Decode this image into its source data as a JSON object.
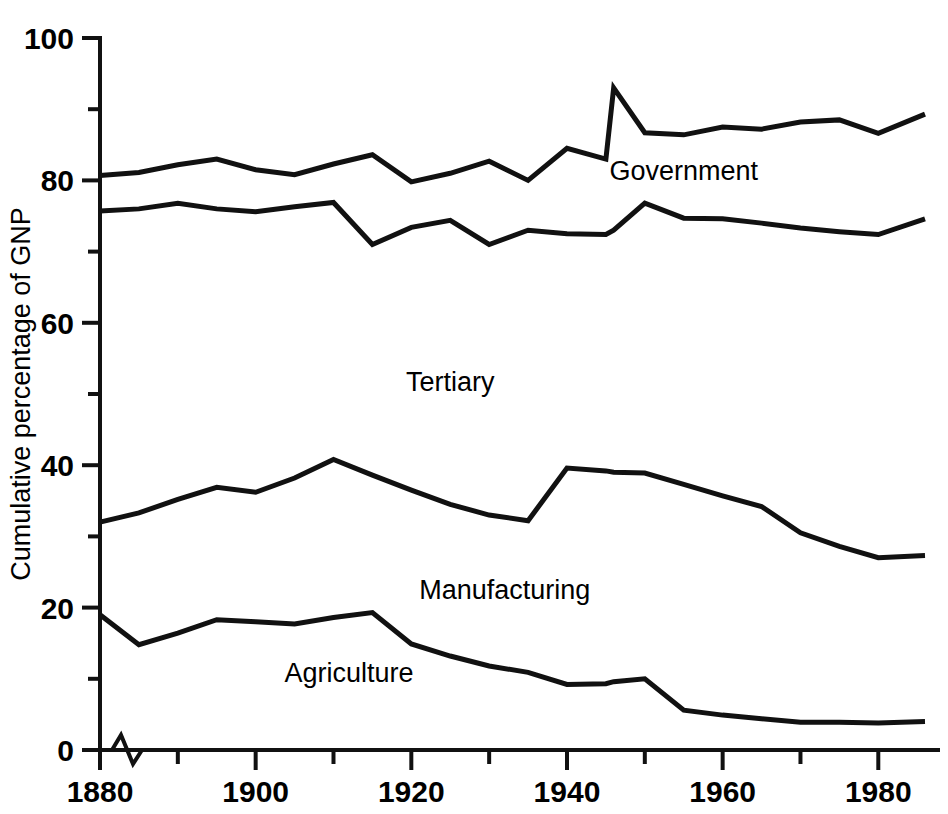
{
  "chart_data": {
    "type": "line",
    "title": "",
    "subtitle": "",
    "xlabel": "",
    "ylabel": "Cumulative percentage of GNP",
    "xlim": [
      1880,
      1986
    ],
    "ylim": [
      0,
      100
    ],
    "grid": false,
    "legend_position": "inline-annotations",
    "x_major_ticks": [
      1880,
      1900,
      1920,
      1940,
      1960,
      1980
    ],
    "x_minor_ticks": [
      1890,
      1910,
      1930,
      1950,
      1970
    ],
    "x_tick_labels": [
      "1880",
      "1900",
      "1920",
      "1940",
      "1960",
      "1980"
    ],
    "y_major_ticks": [
      0,
      20,
      40,
      60,
      80,
      100
    ],
    "y_minor_ticks": [
      10,
      30,
      50,
      70,
      90
    ],
    "y_tick_labels": [
      "0",
      "20",
      "40",
      "60",
      "80",
      "100"
    ],
    "axis_break": true,
    "axis_break_note": "zigzag break mark on x-axis just right of origin",
    "x": [
      1880,
      1885,
      1890,
      1895,
      1900,
      1905,
      1910,
      1915,
      1920,
      1925,
      1930,
      1935,
      1940,
      1945,
      1946,
      1950,
      1955,
      1960,
      1965,
      1970,
      1975,
      1980,
      1986
    ],
    "series": [
      {
        "name": "Agriculture",
        "label": "Agriculture",
        "color": "#111111",
        "values": [
          19.0,
          14.8,
          16.4,
          18.3,
          18.0,
          17.7,
          18.6,
          19.3,
          14.9,
          13.2,
          11.8,
          10.9,
          9.2,
          9.3,
          9.6,
          10.0,
          5.6,
          4.9,
          4.4,
          3.9,
          3.9,
          3.8,
          4.0
        ]
      },
      {
        "name": "Manufacturing",
        "label": "Manufacturing",
        "color": "#111111",
        "values": [
          32.0,
          33.3,
          35.2,
          36.9,
          36.2,
          38.2,
          40.8,
          38.6,
          36.5,
          34.5,
          33.0,
          32.2,
          39.6,
          39.2,
          39.0,
          38.9,
          37.3,
          35.7,
          34.2,
          30.5,
          28.6,
          27.0,
          27.3
        ]
      },
      {
        "name": "Tertiary",
        "label": "Tertiary",
        "color": "#111111",
        "values": [
          75.7,
          76.0,
          76.8,
          76.0,
          75.6,
          76.3,
          76.9,
          71.0,
          73.4,
          74.4,
          71.0,
          73.0,
          72.5,
          72.4,
          73.0,
          76.8,
          74.7,
          74.6,
          74.0,
          73.3,
          72.8,
          72.4,
          74.6
        ]
      },
      {
        "name": "Government",
        "label": "Government",
        "color": "#111111",
        "values": [
          80.7,
          81.1,
          82.2,
          83.0,
          81.5,
          80.8,
          82.3,
          83.6,
          79.8,
          81.0,
          82.7,
          80.0,
          84.5,
          83.0,
          93.0,
          86.7,
          86.4,
          87.5,
          87.2,
          88.2,
          88.5,
          86.6,
          89.3
        ]
      }
    ],
    "annotations": [
      {
        "text": "Government",
        "x": 1955,
        "y": 80.0
      },
      {
        "text": "Tertiary",
        "x": 1925,
        "y": 50.4
      },
      {
        "text": "Manufacturing",
        "x": 1932,
        "y": 21.2
      },
      {
        "text": "Agriculture",
        "x": 1912,
        "y": 9.6
      }
    ]
  }
}
